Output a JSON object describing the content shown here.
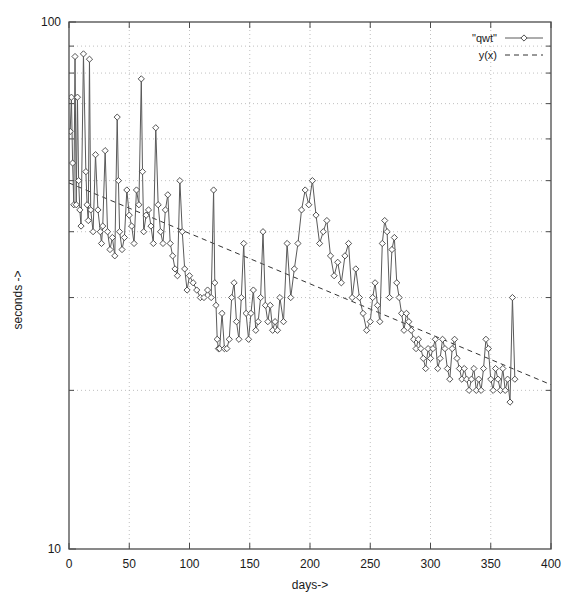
{
  "chart_data": {
    "type": "line",
    "title": "",
    "xlabel": "days->",
    "ylabel": "seconds ->",
    "yscale": "log",
    "xscale": "linear",
    "xlim": [
      0,
      400
    ],
    "ylim": [
      10,
      100
    ],
    "grid": true,
    "legend_position": "top-right",
    "xticks": [
      "0",
      "50",
      "100",
      "150",
      "200",
      "250",
      "300",
      "350",
      "400"
    ],
    "xtick_values": [
      0,
      50,
      100,
      150,
      200,
      250,
      300,
      350,
      400
    ],
    "yticks": [
      "10",
      "100"
    ],
    "ytick_values": [
      10,
      100
    ],
    "yminor_values": [
      20,
      30,
      40,
      50,
      60,
      70,
      80,
      90
    ],
    "series": [
      {
        "name": "\"qwt\"",
        "style": "linespoints",
        "marker": "open-diamond",
        "color": "#4d4d4d",
        "x": [
          1,
          2,
          3,
          4,
          5,
          6,
          7,
          8,
          9,
          10,
          12,
          14,
          15,
          16,
          17,
          18,
          20,
          22,
          24,
          26,
          27,
          28,
          30,
          32,
          34,
          36,
          38,
          40,
          41,
          42,
          44,
          46,
          48,
          50,
          52,
          54,
          56,
          58,
          60,
          61,
          62,
          64,
          66,
          68,
          70,
          72,
          74,
          76,
          78,
          80,
          82,
          84,
          86,
          88,
          90,
          92,
          94,
          96,
          98,
          100,
          103,
          106,
          109,
          112,
          115,
          118,
          120,
          121,
          122,
          123,
          124,
          125,
          127,
          129,
          131,
          133,
          135,
          137,
          139,
          141,
          143,
          145,
          147,
          149,
          151,
          153,
          155,
          157,
          159,
          161,
          163,
          165,
          167,
          169,
          171,
          173,
          175,
          178,
          181,
          184,
          187,
          190,
          193,
          196,
          199,
          202,
          205,
          208,
          211,
          214,
          217,
          220,
          223,
          226,
          229,
          232,
          235,
          238,
          241,
          244,
          247,
          250,
          252,
          254,
          256,
          258,
          260,
          262,
          264,
          266,
          268,
          270,
          272,
          274,
          276,
          278,
          280,
          282,
          284,
          286,
          288,
          290,
          292,
          294,
          296,
          298,
          300,
          302,
          304,
          306,
          308,
          310,
          312,
          314,
          316,
          318,
          320,
          322,
          324,
          326,
          328,
          330,
          332,
          334,
          336,
          338,
          340,
          342,
          344,
          346,
          348,
          350,
          352,
          354,
          356,
          358,
          360,
          362,
          364,
          366,
          368,
          370
        ],
        "y": [
          62,
          72,
          54,
          45,
          86,
          45,
          72,
          50,
          44,
          41,
          87,
          52,
          45,
          42,
          85,
          44,
          40,
          56,
          44,
          40,
          38,
          41,
          57,
          40,
          37,
          39,
          36,
          66,
          50,
          40,
          37,
          39,
          48,
          43,
          41,
          38,
          48,
          45,
          78,
          52,
          40,
          43,
          44,
          41,
          38,
          63,
          45,
          40,
          38,
          44,
          47,
          38,
          36,
          34,
          33,
          50,
          40,
          34,
          31,
          33,
          32,
          31,
          30,
          30,
          31,
          30,
          48,
          32,
          29,
          25,
          24,
          24,
          28,
          24,
          24,
          25,
          30,
          32,
          27,
          25,
          30,
          38,
          28,
          25,
          28,
          31,
          26,
          27,
          30,
          40,
          29,
          27,
          29,
          26,
          27,
          26,
          30,
          27,
          38,
          30,
          34,
          38,
          44,
          48,
          45,
          50,
          43,
          38,
          40,
          42,
          36,
          33,
          35,
          32,
          36,
          38,
          30,
          34,
          30,
          28,
          26,
          27,
          30,
          32,
          29,
          27,
          38,
          42,
          40,
          30,
          37,
          39,
          32,
          30,
          28,
          26,
          28,
          27,
          26,
          25,
          24,
          25,
          24,
          23,
          22,
          24,
          23,
          24,
          25,
          22,
          23,
          25,
          24,
          22,
          21,
          24,
          25,
          23,
          22,
          21,
          22,
          21,
          20,
          21,
          22,
          20,
          21,
          20,
          22,
          25,
          24,
          21,
          20,
          22,
          21,
          20,
          22,
          20,
          21,
          19,
          30,
          21
        ]
      },
      {
        "name": "y(x)",
        "style": "dashed-line",
        "color": "#333333",
        "x": [
          0,
          400
        ],
        "y": [
          49.5,
          20.5
        ],
        "note": "exponential fit trend line"
      }
    ]
  },
  "legend": {
    "entries": [
      {
        "label": "\"qwt\"",
        "symbol": "diamond-line"
      },
      {
        "label": "y(x)",
        "symbol": "dashed-line"
      }
    ]
  },
  "axes": {
    "x_label": "days->",
    "y_label": "seconds ->"
  }
}
